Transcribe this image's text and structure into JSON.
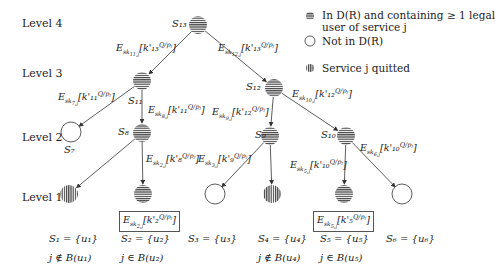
{
  "levels": [
    {
      "label": "Level 4",
      "x": 22,
      "y": 18
    },
    {
      "label": "Level 3",
      "x": 22,
      "y": 68
    },
    {
      "label": "Level 2",
      "x": 22,
      "y": 132
    },
    {
      "label": "Level 1",
      "x": 22,
      "y": 192
    }
  ],
  "legend": {
    "items": [
      {
        "icon": "horizontal-stripe-circle",
        "text": "In D(R) and containing ≥ 1 legal",
        "text2": "user of service j"
      },
      {
        "icon": "empty-circle",
        "text": "Not in D(R)"
      },
      {
        "icon": "vertical-stripe-circle",
        "text": "Service j quitted"
      }
    ]
  },
  "nodes": [
    {
      "id": "S13",
      "label": "S₁₃",
      "type": "hstripe",
      "cx": 198,
      "cy": 25
    },
    {
      "id": "S11",
      "label": "S₁₁",
      "type": "hstripe",
      "cx": 142,
      "cy": 81
    },
    {
      "id": "S12",
      "label": "S₁₂",
      "type": "hstripe",
      "cx": 274,
      "cy": 88
    },
    {
      "id": "S7",
      "label": "S₇",
      "type": "empty",
      "cx": 71,
      "cy": 132
    },
    {
      "id": "S8",
      "label": "S₈",
      "type": "hstripe",
      "cx": 142,
      "cy": 133
    },
    {
      "id": "S9",
      "label": "S₉",
      "type": "hstripe",
      "cx": 270,
      "cy": 136
    },
    {
      "id": "S10",
      "label": "S₁₀",
      "type": "hstripe",
      "cx": 346,
      "cy": 136
    },
    {
      "id": "L1",
      "label": "",
      "type": "vstripe",
      "cx": 69,
      "cy": 194
    },
    {
      "id": "L2",
      "label": "",
      "type": "hstripe",
      "cx": 143,
      "cy": 194
    },
    {
      "id": "L3",
      "label": "",
      "type": "empty",
      "cx": 215,
      "cy": 194
    },
    {
      "id": "L4",
      "label": "",
      "type": "vstripe",
      "cx": 272,
      "cy": 194
    },
    {
      "id": "L5",
      "label": "",
      "type": "hstripe",
      "cx": 344,
      "cy": 194
    },
    {
      "id": "L6",
      "label": "",
      "type": "empty",
      "cx": 402,
      "cy": 194
    }
  ],
  "node_labels": [
    {
      "text": "S₁₃",
      "x": 172,
      "y": 19
    },
    {
      "text": "S₁₁",
      "x": 128,
      "y": 96
    },
    {
      "text": "S₁₂",
      "x": 246,
      "y": 82
    },
    {
      "text": "S₇",
      "x": 64,
      "y": 145
    },
    {
      "text": "S₈",
      "x": 118,
      "y": 127
    },
    {
      "text": "S₉",
      "x": 255,
      "y": 130
    },
    {
      "text": "S₁₀",
      "x": 321,
      "y": 130
    }
  ],
  "edges": [
    {
      "from": "S13",
      "to": "S11",
      "label": "E_{sk_{11,j}}[k'₁₃^{Q/pⱼ}]",
      "lx": 116,
      "ly": 42
    },
    {
      "from": "S13",
      "to": "S12",
      "label": "E_{sk_{12,j}}[k'₁₃^{Q/pⱼ}]",
      "lx": 218,
      "ly": 42
    },
    {
      "from": "S11",
      "to": "S7",
      "label": "E_{sk_{7,j}}[k'₁₁^{Q/pⱼ}]",
      "lx": 58,
      "ly": 91
    },
    {
      "from": "S11",
      "to": "S8",
      "label": "E_{sk_{8,j}}[k'₁₁^{Q/pⱼ}]",
      "lx": 148,
      "ly": 104
    },
    {
      "from": "S12",
      "to": "S9",
      "label": "E_{sk_{9,j}}[k'₁₂^{Q/pⱼ}]",
      "lx": 212,
      "ly": 106
    },
    {
      "from": "S12",
      "to": "S10",
      "label": "E_{sk_{10,j}}[k'₁₂^{Q/pⱼ}]",
      "lx": 292,
      "ly": 88
    },
    {
      "from": "S8",
      "to": "L1",
      "label": "",
      "lx": 0,
      "ly": 0
    },
    {
      "from": "S8",
      "to": "L2",
      "label": "E_{sk_{2,j}}[k'₈^{Q/pⱼ}]",
      "lx": 146,
      "ly": 153
    },
    {
      "from": "S9",
      "to": "L3",
      "label": "E_{sk_{3,j}}[k'₉^{Q/pⱼ}]",
      "lx": 198,
      "ly": 153
    },
    {
      "from": "S9",
      "to": "L4",
      "label": "",
      "lx": 0,
      "ly": 0
    },
    {
      "from": "S10",
      "to": "L5",
      "label": "E_{sk_{5,j}}[k'₁₀^{Q/pⱼ}]",
      "lx": 290,
      "ly": 159
    },
    {
      "from": "S10",
      "to": "L6",
      "label": "E_{sk_{6,j}}[k'₁₀^{Q/pⱼ}]",
      "lx": 360,
      "ly": 142
    }
  ],
  "boxed_labels": [
    {
      "text": "E_{sk_{2,j}}[k'₂^{Q/pⱼ}]",
      "x": 119,
      "y": 211
    },
    {
      "text": "E_{sk_{5,j}}[k'₅^{Q/pⱼ}]",
      "x": 313,
      "y": 211
    }
  ],
  "sets": [
    {
      "text": "S₁ = {u₁}",
      "x": 49,
      "y": 234
    },
    {
      "text": "S₂ = {u₂}",
      "x": 121,
      "y": 234
    },
    {
      "text": "S₃ = {u₃}",
      "x": 188,
      "y": 234
    },
    {
      "text": "S₄ = {u₄}",
      "x": 258,
      "y": 234
    },
    {
      "text": "S₅ = {u₅}",
      "x": 320,
      "y": 234
    },
    {
      "text": "S₆ = {u₆}",
      "x": 386,
      "y": 234
    }
  ],
  "membership": [
    {
      "text": "j ∉ B(u₁)",
      "x": 49,
      "y": 253
    },
    {
      "text": "j ∈ B(u₂)",
      "x": 121,
      "y": 253
    },
    {
      "text": "j ∉ B(u₄)",
      "x": 258,
      "y": 253
    },
    {
      "text": "j ∈ B(u₅)",
      "x": 320,
      "y": 253
    }
  ]
}
